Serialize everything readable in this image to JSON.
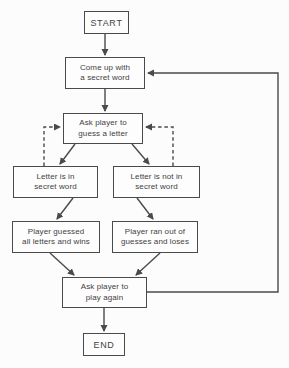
{
  "diagram": {
    "type": "flowchart",
    "colors": {
      "background": "#fcfcfc",
      "line": "#4a4a4a",
      "text": "#424242",
      "box_fill": "#fdfdfd"
    },
    "nodes": [
      {
        "id": "start",
        "shape": "terminal",
        "label": "START"
      },
      {
        "id": "come-up-secret-word",
        "shape": "process",
        "label": "Come up with\na secret word"
      },
      {
        "id": "ask-guess-letter",
        "shape": "process",
        "label": "Ask player to\nguess a letter"
      },
      {
        "id": "letter-in-word",
        "shape": "process",
        "label": "Letter is in\nsecret word"
      },
      {
        "id": "letter-not-in-word",
        "shape": "process",
        "label": "Letter is not in\nsecret word"
      },
      {
        "id": "player-wins",
        "shape": "process",
        "label": "Player guessed\nall letters and wins"
      },
      {
        "id": "player-loses",
        "shape": "process",
        "label": "Player ran out of\nguesses and loses"
      },
      {
        "id": "ask-play-again",
        "shape": "process",
        "label": "Ask player to\nplay again"
      },
      {
        "id": "end",
        "shape": "terminal",
        "label": "END"
      }
    ],
    "edges": [
      {
        "from": "start",
        "to": "come-up-secret-word",
        "style": "solid"
      },
      {
        "from": "come-up-secret-word",
        "to": "ask-guess-letter",
        "style": "solid"
      },
      {
        "from": "ask-guess-letter",
        "to": "letter-in-word",
        "style": "solid"
      },
      {
        "from": "ask-guess-letter",
        "to": "letter-not-in-word",
        "style": "solid"
      },
      {
        "from": "letter-in-word",
        "to": "ask-guess-letter",
        "style": "dashed"
      },
      {
        "from": "letter-not-in-word",
        "to": "ask-guess-letter",
        "style": "dashed"
      },
      {
        "from": "letter-in-word",
        "to": "player-wins",
        "style": "solid"
      },
      {
        "from": "letter-not-in-word",
        "to": "player-loses",
        "style": "solid"
      },
      {
        "from": "player-wins",
        "to": "ask-play-again",
        "style": "solid"
      },
      {
        "from": "player-loses",
        "to": "ask-play-again",
        "style": "solid"
      },
      {
        "from": "ask-play-again",
        "to": "come-up-secret-word",
        "style": "solid",
        "route": "right-side-loop"
      },
      {
        "from": "ask-play-again",
        "to": "end",
        "style": "solid"
      }
    ]
  }
}
